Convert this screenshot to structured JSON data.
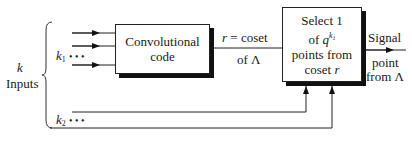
{
  "diagram": {
    "type": "block-diagram",
    "inputs_group": {
      "label_var": "k",
      "label_text": "Inputs"
    },
    "k1_group": {
      "var": "k",
      "sub": "1",
      "dots": "• • •"
    },
    "k2_group": {
      "var": "k",
      "sub": "2",
      "dots": "• • •"
    },
    "conv_box": {
      "line1": "Convolutional",
      "line2": "code"
    },
    "r_link": {
      "top_var": "r",
      "top_text": " = coset",
      "bottom_text": "of Λ"
    },
    "select_box": {
      "line1": "Select 1",
      "line2_prefix": "of ",
      "line2_var": "q",
      "line2_sup_var": "k",
      "line2_sup_sub": "1",
      "line3": "points from",
      "line4_prefix": "coset ",
      "line4_var": "r"
    },
    "output": {
      "top": "Signal",
      "bottom1": "point",
      "bottom2": "from Λ"
    },
    "colors": {
      "line": "#222222",
      "shadow": "#111111",
      "background": "#ffffff"
    }
  }
}
